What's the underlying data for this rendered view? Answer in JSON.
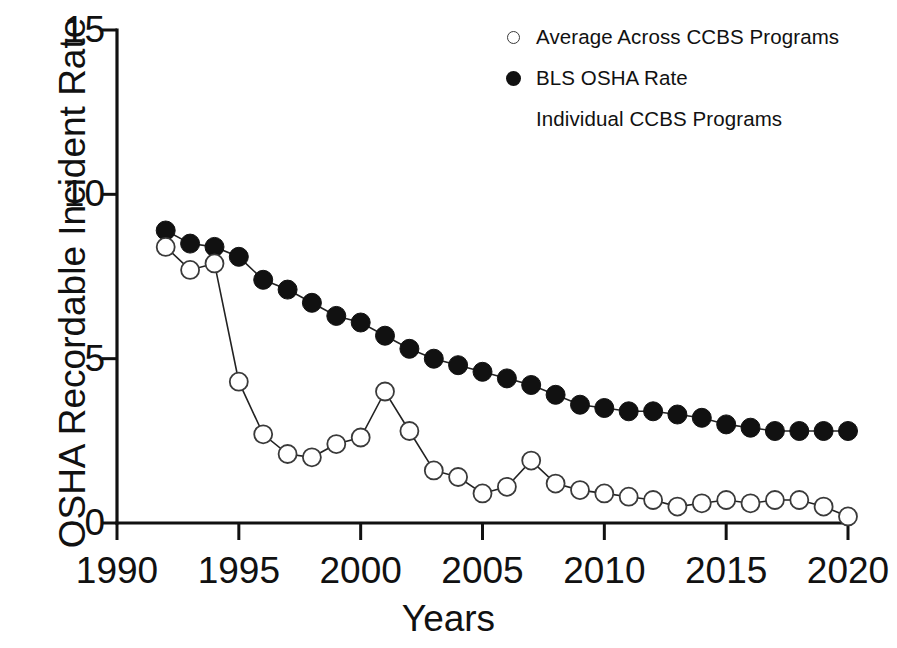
{
  "chart_data": {
    "type": "line",
    "title": "",
    "xlabel": "Years",
    "ylabel": "OSHA  Recordable Incident Rate",
    "xlim": [
      1990,
      2020
    ],
    "ylim": [
      0,
      15
    ],
    "xticks": [
      1990,
      1995,
      2000,
      2005,
      2010,
      2015,
      2020
    ],
    "yticks": [
      0,
      5,
      10,
      15
    ],
    "grid": false,
    "legend_position": "top-right",
    "x": [
      1992,
      1993,
      1994,
      1995,
      1996,
      1997,
      1998,
      1999,
      2000,
      2001,
      2002,
      2003,
      2004,
      2005,
      2006,
      2007,
      2008,
      2009,
      2010,
      2011,
      2012,
      2013,
      2014,
      2015,
      2016,
      2017,
      2018,
      2019,
      2020
    ],
    "series": [
      {
        "name": "BLS OSHA Rate",
        "marker": "filled-circle",
        "values": [
          8.9,
          8.5,
          8.4,
          8.1,
          7.4,
          7.1,
          6.7,
          6.3,
          6.1,
          5.7,
          5.3,
          5.0,
          4.8,
          4.6,
          4.4,
          4.2,
          3.9,
          3.6,
          3.5,
          3.4,
          3.4,
          3.3,
          3.2,
          3.0,
          2.9,
          2.8,
          2.8,
          2.8,
          2.8
        ]
      },
      {
        "name": "Average Across CCBS Programs",
        "marker": "open-circle",
        "values": [
          8.4,
          7.7,
          7.9,
          4.3,
          2.7,
          2.1,
          2.0,
          2.4,
          2.6,
          4.0,
          2.8,
          1.6,
          1.4,
          0.9,
          1.1,
          1.9,
          1.2,
          1.0,
          0.9,
          0.8,
          0.7,
          0.5,
          0.6,
          0.7,
          0.6,
          0.7,
          0.7,
          0.5,
          0.2
        ]
      }
    ],
    "legend": [
      {
        "label": "Average Across CCBS Programs",
        "marker": "open-circle"
      },
      {
        "label": "BLS OSHA Rate",
        "marker": "filled-circle"
      },
      {
        "label": "Individual CCBS Programs",
        "marker": "none"
      }
    ]
  }
}
